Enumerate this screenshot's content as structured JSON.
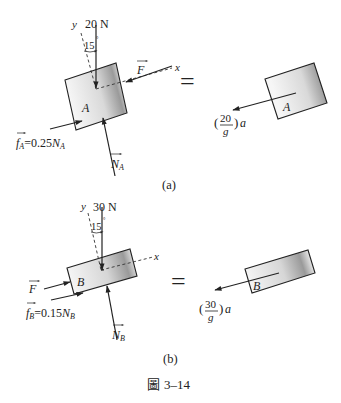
{
  "figure": {
    "caption_prefix": "圖",
    "caption_number": "3–14"
  },
  "panel_a": {
    "label": "(a)",
    "body_label": "A",
    "weight": "20 N",
    "y_axis": "y",
    "x_axis": "x",
    "angle": "15",
    "applied_force": "F",
    "friction_symbol": "f",
    "friction_sub": "A",
    "friction_eq": "=0.25",
    "friction_N": "N",
    "friction_N_sub": "A",
    "normal_symbol": "N",
    "normal_sub": "A",
    "equals": "=",
    "ma_open": "(",
    "ma_num": "20",
    "ma_den": "g",
    "ma_close": ")",
    "ma_a": "a",
    "right_body_label": "A"
  },
  "panel_b": {
    "label": "(b)",
    "body_label": "B",
    "weight": "30 N",
    "y_axis": "y",
    "x_axis": "x",
    "angle": "15",
    "applied_force": "F",
    "friction_symbol": "f",
    "friction_sub": "B",
    "friction_eq": "=0.15",
    "friction_N": "N",
    "friction_N_sub": "B",
    "normal_symbol": "N",
    "normal_sub": "B",
    "equals": "=",
    "ma_open": "(",
    "ma_num": "30",
    "ma_den": "g",
    "ma_close": ")",
    "ma_a": "a",
    "right_body_label": "B"
  },
  "colors": {
    "ink": "#222222",
    "block_light": "#f4f4f4",
    "block_dark": "#8a8a8a"
  }
}
